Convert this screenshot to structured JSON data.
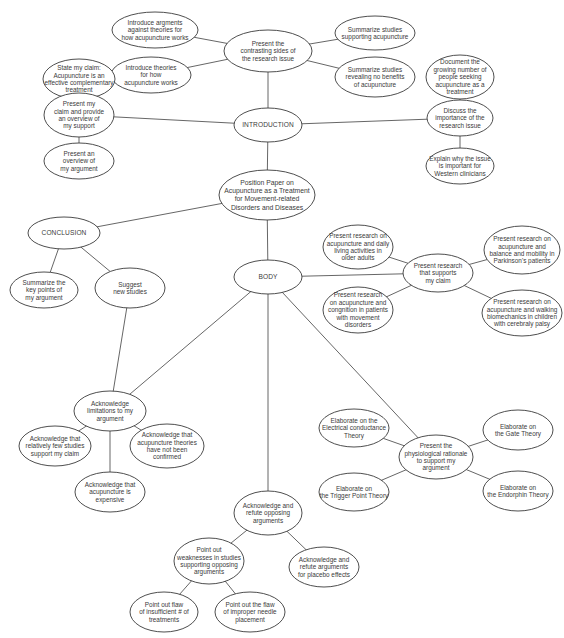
{
  "diagram": {
    "colors": {
      "stroke": "#3a3a3a",
      "edge": "#555555",
      "background": "#ffffff",
      "text": "#3a3a3a"
    },
    "nodes": [
      {
        "id": "root",
        "cx": 267,
        "cy": 195,
        "rx": 48,
        "ry": 25,
        "style": "root",
        "lines": [
          "Position Paper on",
          "Acupuncture as a Treatment",
          "for Movement-related",
          "Disorders and Diseases"
        ]
      },
      {
        "id": "introduction",
        "cx": 268,
        "cy": 125,
        "rx": 34,
        "ry": 17,
        "style": "caps",
        "lines": [
          "INTRODUCTION"
        ]
      },
      {
        "id": "contrasting-sides",
        "cx": 268,
        "cy": 51,
        "rx": 44,
        "ry": 21,
        "lines": [
          "Present the",
          "contrasting sides of",
          "the research issue"
        ]
      },
      {
        "id": "args-against-theories",
        "cx": 155,
        "cy": 30,
        "rx": 43,
        "ry": 18,
        "lines": [
          "Introduce argments",
          "against theories for",
          "how acupuncture works"
        ]
      },
      {
        "id": "theories-how",
        "cx": 151,
        "cy": 75,
        "rx": 40,
        "ry": 18,
        "lines": [
          "Introduce theories",
          "for how",
          "acupuncture works"
        ]
      },
      {
        "id": "studies-supporting",
        "cx": 375,
        "cy": 33,
        "rx": 40,
        "ry": 17,
        "lines": [
          "Summarize studies",
          "supporting acupuncture"
        ]
      },
      {
        "id": "studies-no-benefits",
        "cx": 375,
        "cy": 77,
        "rx": 40,
        "ry": 20,
        "lines": [
          "Summarize studies",
          "revealing no benefits",
          "of acupuncture"
        ]
      },
      {
        "id": "state-claim",
        "cx": 79,
        "cy": 79,
        "rx": 36,
        "ry": 20,
        "lines": [
          "State my claim:",
          "Acupuncture is an",
          "effective complementary",
          "treatment"
        ]
      },
      {
        "id": "present-claim-overview",
        "cx": 79,
        "cy": 115,
        "rx": 35,
        "ry": 22,
        "lines": [
          "Present my",
          "claim and provide",
          "an overview of",
          "my support"
        ]
      },
      {
        "id": "overview-argument",
        "cx": 79,
        "cy": 161,
        "rx": 35,
        "ry": 18,
        "lines": [
          "Present an",
          "overview of",
          "my argument"
        ]
      },
      {
        "id": "document-growing",
        "cx": 460,
        "cy": 77,
        "rx": 34,
        "ry": 22,
        "lines": [
          "Document the",
          "growing number of",
          "people seeking",
          "acupuncture as a",
          "treatment"
        ]
      },
      {
        "id": "discuss-importance",
        "cx": 460,
        "cy": 118,
        "rx": 33,
        "ry": 18,
        "lines": [
          "Discuss the",
          "importance of the",
          "research issue"
        ]
      },
      {
        "id": "explain-western",
        "cx": 460,
        "cy": 166,
        "rx": 34,
        "ry": 18,
        "lines": [
          "Explain why the issue",
          "is important for",
          "Western clinicians"
        ]
      },
      {
        "id": "conclusion",
        "cx": 64,
        "cy": 233,
        "rx": 36,
        "ry": 16,
        "style": "caps",
        "lines": [
          "CONCLUSION"
        ]
      },
      {
        "id": "summarize-key-points",
        "cx": 44,
        "cy": 290,
        "rx": 34,
        "ry": 18,
        "lines": [
          "Summarize the",
          "key points of",
          "my argument"
        ]
      },
      {
        "id": "suggest-new-studies",
        "cx": 130,
        "cy": 288,
        "rx": 35,
        "ry": 20,
        "lines": [
          "Suggest",
          "new studies"
        ]
      },
      {
        "id": "body",
        "cx": 268,
        "cy": 277,
        "rx": 34,
        "ry": 17,
        "style": "caps",
        "lines": [
          "BODY"
        ]
      },
      {
        "id": "research-supports-claim",
        "cx": 438,
        "cy": 273,
        "rx": 35,
        "ry": 19,
        "lines": [
          "Present research",
          "that supports",
          "my claim"
        ]
      },
      {
        "id": "research-daily-living",
        "cx": 358,
        "cy": 247,
        "rx": 35,
        "ry": 22,
        "lines": [
          "Present research on",
          "acupuncture and daily",
          "living activities in",
          "older adults"
        ]
      },
      {
        "id": "research-cognition",
        "cx": 358,
        "cy": 310,
        "rx": 35,
        "ry": 23,
        "lines": [
          "Present research",
          "on acupuncture and",
          "congnition in patients",
          "with movement",
          "disorders"
        ]
      },
      {
        "id": "research-parkinsons",
        "cx": 522,
        "cy": 250,
        "rx": 38,
        "ry": 24,
        "lines": [
          "Present research on",
          "acupuncture and",
          "balance and mobility in",
          "Parkinson's patients"
        ]
      },
      {
        "id": "research-walking",
        "cx": 522,
        "cy": 313,
        "rx": 40,
        "ry": 23,
        "lines": [
          "Present research on",
          "acupuncture and walking",
          "biomechanics in children",
          "with cerebraly palsy"
        ]
      },
      {
        "id": "acknowledge-limitations",
        "cx": 110,
        "cy": 411,
        "rx": 36,
        "ry": 20,
        "lines": [
          "Acknowledge",
          "limitations to my",
          "argument"
        ]
      },
      {
        "id": "ack-few-studies",
        "cx": 55,
        "cy": 446,
        "rx": 36,
        "ry": 20,
        "lines": [
          "Acknowledge that",
          "relatively few studies",
          "support my claim"
        ]
      },
      {
        "id": "ack-theories-not-confirmed",
        "cx": 167,
        "cy": 446,
        "rx": 37,
        "ry": 22,
        "lines": [
          "Acknowledge that",
          "acupuncture theories",
          "have not been",
          "confirmed"
        ]
      },
      {
        "id": "ack-expensive",
        "cx": 110,
        "cy": 492,
        "rx": 35,
        "ry": 20,
        "lines": [
          "Acknowledge that",
          "acupuncture is",
          "expensive"
        ]
      },
      {
        "id": "physiological-rationale",
        "cx": 436,
        "cy": 457,
        "rx": 37,
        "ry": 22,
        "lines": [
          "Present the",
          "physiological rationale",
          "to support my",
          "argument"
        ]
      },
      {
        "id": "electrical-theory",
        "cx": 354,
        "cy": 428,
        "rx": 35,
        "ry": 19,
        "lines": [
          "Elaborate on the",
          "Electrical conductance",
          "Theory"
        ]
      },
      {
        "id": "trigger-point-theory",
        "cx": 354,
        "cy": 492,
        "rx": 35,
        "ry": 19,
        "lines": [
          "Elaborate on",
          "the Trigger Point Theory"
        ]
      },
      {
        "id": "gate-theory",
        "cx": 518,
        "cy": 430,
        "rx": 35,
        "ry": 20,
        "lines": [
          "Elaborate on",
          "the Gate Theory"
        ]
      },
      {
        "id": "endorphin-theory",
        "cx": 518,
        "cy": 491,
        "rx": 35,
        "ry": 20,
        "lines": [
          "Elaborate on",
          "the Endorphin Theory"
        ]
      },
      {
        "id": "refute-opposing",
        "cx": 268,
        "cy": 513,
        "rx": 34,
        "ry": 22,
        "lines": [
          "Acknowledge and",
          "refute opposing",
          "arguments"
        ]
      },
      {
        "id": "weaknesses-opposing",
        "cx": 209,
        "cy": 561,
        "rx": 35,
        "ry": 23,
        "lines": [
          "Point out",
          "weaknesses in studies",
          "supporting opposing",
          "arguments"
        ]
      },
      {
        "id": "refute-placebo",
        "cx": 324,
        "cy": 567,
        "rx": 35,
        "ry": 20,
        "lines": [
          "Acknowledge and",
          "refute arguments",
          "for placebo effects"
        ]
      },
      {
        "id": "flaw-insufficient",
        "cx": 164,
        "cy": 612,
        "rx": 34,
        "ry": 20,
        "lines": [
          "Point out flaw",
          "of insufficient # of",
          "treatments"
        ]
      },
      {
        "id": "flaw-needle",
        "cx": 250,
        "cy": 612,
        "rx": 35,
        "ry": 20,
        "lines": [
          "Point out the flaw",
          "of improper needle",
          "placement"
        ]
      }
    ],
    "edges": [
      [
        "root",
        "introduction"
      ],
      [
        "root",
        "conclusion"
      ],
      [
        "root",
        "body"
      ],
      [
        "introduction",
        "contrasting-sides"
      ],
      [
        "introduction",
        "present-claim-overview"
      ],
      [
        "introduction",
        "discuss-importance"
      ],
      [
        "contrasting-sides",
        "args-against-theories"
      ],
      [
        "contrasting-sides",
        "theories-how"
      ],
      [
        "contrasting-sides",
        "studies-supporting"
      ],
      [
        "contrasting-sides",
        "studies-no-benefits"
      ],
      [
        "present-claim-overview",
        "state-claim"
      ],
      [
        "present-claim-overview",
        "overview-argument"
      ],
      [
        "discuss-importance",
        "document-growing"
      ],
      [
        "discuss-importance",
        "explain-western"
      ],
      [
        "conclusion",
        "summarize-key-points"
      ],
      [
        "conclusion",
        "suggest-new-studies"
      ],
      [
        "suggest-new-studies",
        "acknowledge-limitations"
      ],
      [
        "body",
        "research-supports-claim"
      ],
      [
        "body",
        "acknowledge-limitations"
      ],
      [
        "body",
        "refute-opposing"
      ],
      [
        "body",
        "physiological-rationale"
      ],
      [
        "research-supports-claim",
        "research-daily-living"
      ],
      [
        "research-supports-claim",
        "research-cognition"
      ],
      [
        "research-supports-claim",
        "research-parkinsons"
      ],
      [
        "research-supports-claim",
        "research-walking"
      ],
      [
        "acknowledge-limitations",
        "ack-few-studies"
      ],
      [
        "acknowledge-limitations",
        "ack-theories-not-confirmed"
      ],
      [
        "acknowledge-limitations",
        "ack-expensive"
      ],
      [
        "physiological-rationale",
        "electrical-theory"
      ],
      [
        "physiological-rationale",
        "trigger-point-theory"
      ],
      [
        "physiological-rationale",
        "gate-theory"
      ],
      [
        "physiological-rationale",
        "endorphin-theory"
      ],
      [
        "refute-opposing",
        "weaknesses-opposing"
      ],
      [
        "refute-opposing",
        "refute-placebo"
      ],
      [
        "weaknesses-opposing",
        "flaw-insufficient"
      ],
      [
        "weaknesses-opposing",
        "flaw-needle"
      ]
    ]
  }
}
